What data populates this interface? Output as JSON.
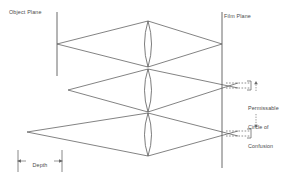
{
  "diagram": {
    "background_color": "#ffffff",
    "line_color": "#5a5a5a",
    "text_color": "#4a4a4a",
    "labels": {
      "object_plane": "Object Plane",
      "film_plane": "Film Plane",
      "circle_of_confusion": {
        "line1": "Permissable",
        "line2": "Circle of",
        "line3": "Confusion"
      },
      "depth_of_field": {
        "line1": "Depth",
        "line2": "of",
        "line3": "Field"
      }
    },
    "elements": {
      "object_plane_line": "vertical-line",
      "film_plane_line": "vertical-line",
      "lens_top": "biconvex-lens",
      "lens_middle": "biconvex-lens",
      "lens_bottom": "biconvex-lens",
      "ray_cone_in_focus": "converges-at-film-plane",
      "ray_cone_near_limit": "converges-behind-film-plane",
      "ray_cone_far_limit": "converges-behind-film-plane",
      "coc_bracket_upper": "dashed-bracket",
      "coc_bracket_lower": "dashed-bracket",
      "dof_extent_marker": "double-arrow-with-end-bars"
    }
  }
}
